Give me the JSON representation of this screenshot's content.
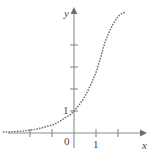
{
  "figure": {
    "name": "exponential-function-graph",
    "background_color": "#ffffff",
    "axis_color": "#8a8a8a",
    "curve_color": "#6e6e6e",
    "text_color": "#4a4a4a"
  },
  "labels": {
    "y_axis": "y",
    "x_axis": "x",
    "origin": "0",
    "x_one": "1",
    "y_one": "1"
  },
  "chart_data": {
    "type": "line",
    "title": "",
    "xlabel": "x",
    "ylabel": "y",
    "subtitle": "",
    "grid": false,
    "legend": null,
    "line_style": "dotted",
    "curve_label": "",
    "annotations": [],
    "xlim": [
      -3.2,
      3.0
    ],
    "ylim": [
      -0.35,
      5.6
    ],
    "xticks": [
      -2,
      -1,
      1,
      2
    ],
    "xtick_labels": [
      "",
      "",
      "1",
      ""
    ],
    "yticks": [
      1,
      2,
      3,
      4
    ],
    "ytick_labels": [
      "1",
      "",
      "",
      ""
    ],
    "origin": [
      0,
      0
    ],
    "unit_px": 22,
    "series": [
      {
        "name": "y = a^x (a > 1)",
        "base": 2.75,
        "x": [
          -3.2,
          -3.0,
          -2.8,
          -2.6,
          -2.4,
          -2.2,
          -2.0,
          -1.8,
          -1.6,
          -1.4,
          -1.2,
          -1.0,
          -0.8,
          -0.6,
          -0.4,
          -0.2,
          0.0,
          0.2,
          0.4,
          0.6,
          0.8,
          1.0,
          1.2,
          1.4,
          1.6,
          1.8,
          2.0,
          2.2,
          2.35
        ],
        "y": [
          0.04,
          0.05,
          0.06,
          0.07,
          0.08,
          0.1,
          0.13,
          0.16,
          0.2,
          0.25,
          0.31,
          0.36,
          0.45,
          0.56,
          0.7,
          0.81,
          1.0,
          1.23,
          1.51,
          1.86,
          2.28,
          2.75,
          3.4,
          4.1,
          4.6,
          5.0,
          5.3,
          5.45,
          5.5
        ]
      }
    ]
  }
}
